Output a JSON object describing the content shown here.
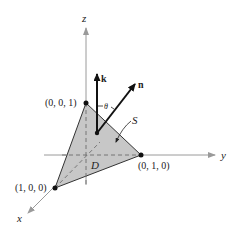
{
  "diagram": {
    "type": "3d-surface-normal",
    "colors": {
      "axis": "#9a9a9a",
      "surface_fill": "#c4c4c4",
      "surface_edge": "#333333",
      "vector": "#111111",
      "dashed": "#777777"
    },
    "axes": {
      "x_label": "x",
      "y_label": "y",
      "z_label": "z"
    },
    "points": [
      {
        "name": "z-intercept",
        "label": "(0, 0, 1)"
      },
      {
        "name": "x-intercept",
        "label": "(1, 0, 0)"
      },
      {
        "name": "y-intercept",
        "label": "(0, 1, 0)"
      }
    ],
    "vectors": {
      "k_label": "k",
      "n_label": "n"
    },
    "angle_label": "θ",
    "surface_label": "S",
    "region_label": "D"
  }
}
